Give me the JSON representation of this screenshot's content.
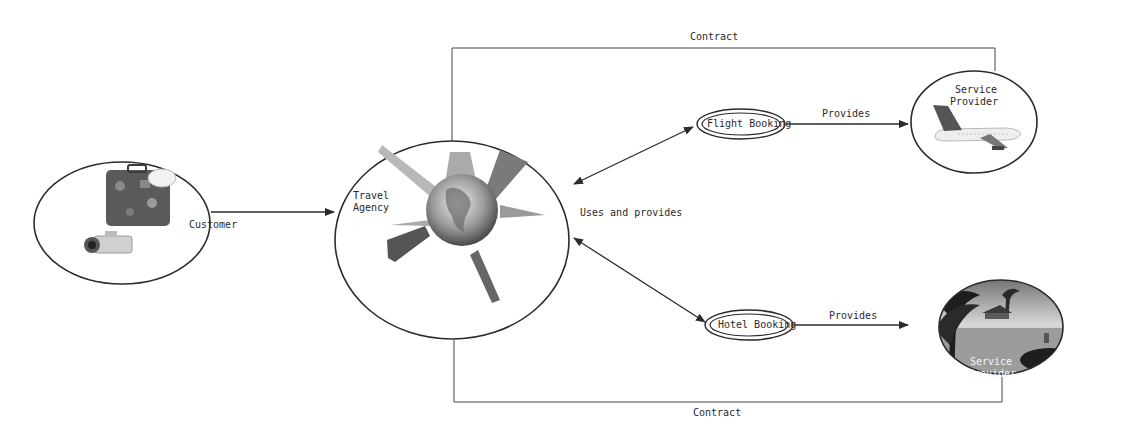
{
  "diagram": {
    "type": "context/use-case diagram",
    "nodes": {
      "customer": {
        "label": "Customer",
        "icon": "luggage-camera-icon"
      },
      "travel_agency": {
        "label_line1": "Travel",
        "label_line2": "Agency",
        "icon": "globe-landmarks-icon"
      },
      "flight_booking": {
        "label": "Flight Booking"
      },
      "hotel_booking": {
        "label": "Hotel Booking"
      },
      "flight_provider": {
        "label_line1": "Service",
        "label_line2": "Provider",
        "icon": "airplane-icon"
      },
      "hotel_provider": {
        "label_line1": "Service",
        "label_line2": "Provider",
        "icon": "tropical-resort-icon"
      }
    },
    "edges": {
      "customer_to_agency": {
        "label": ""
      },
      "agency_uses": {
        "label": "Uses and provides"
      },
      "flight_provides": {
        "label": "Provides"
      },
      "hotel_provides": {
        "label": "Provides"
      },
      "contract_top": {
        "label": "Contract"
      },
      "contract_bottom": {
        "label": "Contract"
      }
    },
    "colors": {
      "line": "#2b2b2b",
      "background": "#ffffff",
      "resort_dark": "#1e1e1e"
    }
  }
}
